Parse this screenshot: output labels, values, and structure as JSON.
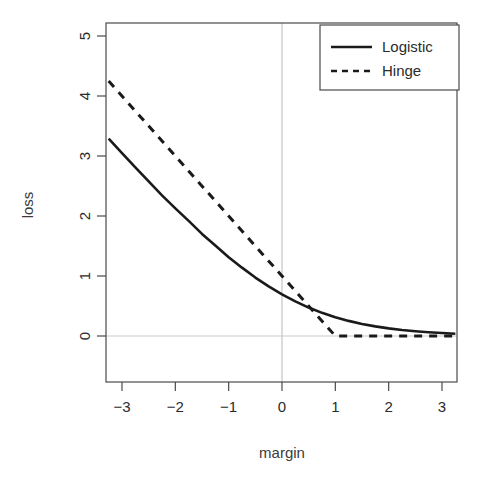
{
  "chart_data": {
    "type": "line",
    "title": "",
    "xlabel": "margin",
    "ylabel": "loss",
    "xlim": [
      -3.3,
      3.3
    ],
    "ylim": [
      -0.72,
      5.35
    ],
    "grid": false,
    "legend_position": "top-right",
    "xticks": [
      -3,
      -2,
      -1,
      0,
      1,
      2,
      3
    ],
    "xtick_labels": [
      "-3",
      "-2",
      "-1",
      "0",
      "1",
      "2",
      "3"
    ],
    "yticks": [
      0,
      1,
      2,
      3,
      4,
      5
    ],
    "ytick_labels": [
      "0",
      "1",
      "2",
      "3",
      "4",
      "5"
    ],
    "reference_lines": [
      {
        "name": "vertical-zero-line",
        "orientation": "vertical",
        "value": 0,
        "color": "#b9b9b9"
      },
      {
        "name": "horizontal-zero-line",
        "orientation": "horizontal",
        "value": 0,
        "color": "#c6c6c6"
      }
    ],
    "series": [
      {
        "name": "Logistic",
        "style": "solid",
        "color": "#1a1a1a",
        "formula": "log(1 + exp(-margin))",
        "x": [
          -3.25,
          -3.0,
          -2.75,
          -2.5,
          -2.25,
          -2.0,
          -1.75,
          -1.5,
          -1.25,
          -1.0,
          -0.75,
          -0.5,
          -0.25,
          0.0,
          0.25,
          0.5,
          0.75,
          1.0,
          1.25,
          1.5,
          1.75,
          2.0,
          2.25,
          2.5,
          2.75,
          3.0,
          3.25
        ],
        "y": [
          3.288,
          3.049,
          2.811,
          2.576,
          2.344,
          2.127,
          1.918,
          1.701,
          1.508,
          1.313,
          1.139,
          0.974,
          0.826,
          0.693,
          0.576,
          0.474,
          0.386,
          0.313,
          0.252,
          0.201,
          0.16,
          0.127,
          0.1,
          0.079,
          0.062,
          0.049,
          0.038
        ]
      },
      {
        "name": "Hinge",
        "style": "dashed",
        "color": "#1a1a1a",
        "formula": "max(0, 1 - margin)",
        "x": [
          -3.25,
          -3.0,
          -2.0,
          -1.0,
          0.0,
          1.0,
          2.0,
          3.0,
          3.25
        ],
        "y": [
          4.25,
          4.0,
          3.0,
          2.0,
          1.0,
          0.0,
          0.0,
          0.0,
          0.0
        ]
      }
    ],
    "legend": [
      {
        "label": "Logistic",
        "style": "solid"
      },
      {
        "label": "Hinge",
        "style": "dashed"
      }
    ]
  },
  "axes": {
    "x_title": "margin",
    "y_title": "loss"
  }
}
